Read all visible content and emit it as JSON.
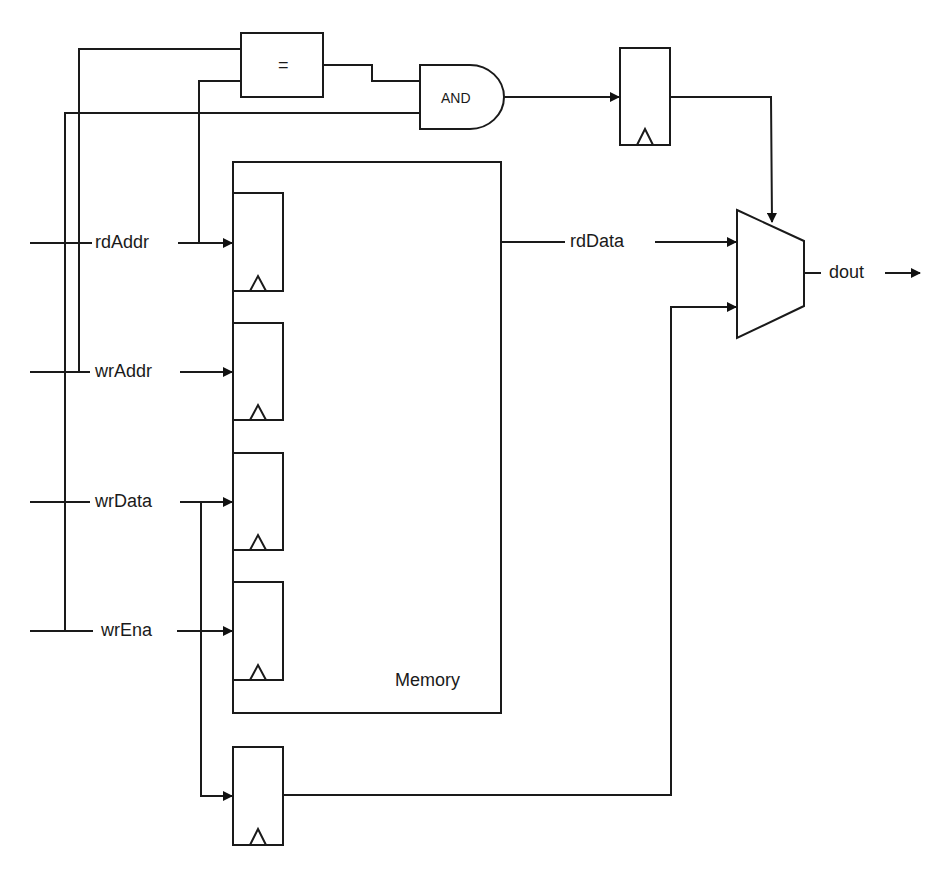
{
  "diagram": {
    "inputs": [
      {
        "id": "rdAddr",
        "label": "rdAddr"
      },
      {
        "id": "wrAddr",
        "label": "wrAddr"
      },
      {
        "id": "wrData",
        "label": "wrData"
      },
      {
        "id": "wrEna",
        "label": "wrEna"
      }
    ],
    "blocks": {
      "comparator": {
        "label": "="
      },
      "and_gate": {
        "label": "AND"
      },
      "memory": {
        "label": "Memory"
      },
      "mux": {
        "label": ""
      }
    },
    "signals": {
      "rdData": "rdData",
      "dout": "dout"
    },
    "colors": {
      "line": "#1a1a1a",
      "background": "#ffffff"
    }
  }
}
